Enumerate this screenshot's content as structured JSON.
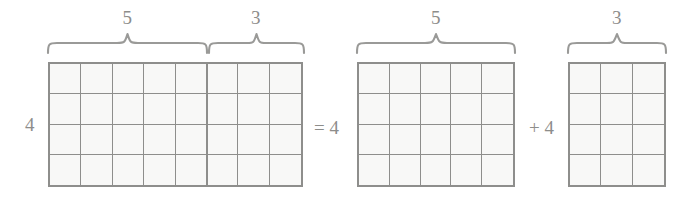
{
  "figure": {
    "equation_text": "4 x (5 + 3) = 4 x 5 + 4 x 3",
    "colors": {
      "background": "#ffffff",
      "grid_line": "#8e8e8c",
      "cell_fill": "#f8f8f7",
      "text": "#8d8d8b",
      "brace": "#9a9a98"
    }
  },
  "left_expression": {
    "row_label": "4",
    "brace_labels": {
      "first": "5",
      "second": "3"
    },
    "grid": {
      "rows": 4,
      "columns": 8,
      "split_after_column": 5
    }
  },
  "equals_operator": "= 4",
  "middle_term": {
    "brace_label": "5",
    "grid": {
      "rows": 4,
      "columns": 5
    }
  },
  "plus_operator": "+ 4",
  "right_term": {
    "brace_label": "3",
    "grid": {
      "rows": 4,
      "columns": 3
    }
  }
}
